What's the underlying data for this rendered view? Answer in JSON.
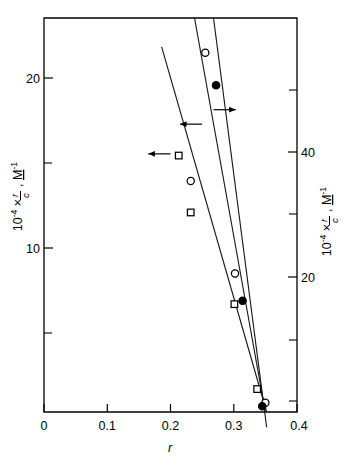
{
  "figure": {
    "title": "",
    "background_color": "#ffffff",
    "ink_color": "#000000"
  },
  "chart_data": {
    "type": "scatter",
    "title": "",
    "subtitle": "",
    "xlabel": "r",
    "ylabel": "10⁻⁴ × r/c,  M⁻¹",
    "ylabel_right": "10⁻⁴ × r/c,  M⁻¹",
    "xlim": [
      0,
      0.4
    ],
    "ylim": [
      0,
      23.2
    ],
    "ylim_right": [
      0,
      54.5
    ],
    "grid": false,
    "legend": "none",
    "xticks": [
      "0",
      "0.1",
      "0.2",
      "0.3",
      "0.4"
    ],
    "xtick_values": [
      0,
      0.1,
      0.2,
      0.3,
      0.4
    ],
    "yticks_left": [
      "10",
      "20"
    ],
    "ytick_values_left": [
      10,
      20
    ],
    "ytick_minor_left": [
      5,
      15
    ],
    "yticks_right": [
      "20",
      "40"
    ],
    "ytick_values_right": [
      20,
      40
    ],
    "ytick_minor_right": [
      10,
      30,
      50
    ],
    "series": [
      {
        "name": "open-circle-series",
        "marker": "open-circle",
        "axis": "left",
        "points": [
          {
            "x": 0.255,
            "y": 21.15
          },
          {
            "x": 0.232,
            "y": 13.6
          },
          {
            "x": 0.302,
            "y": 8.15
          },
          {
            "x": 0.35,
            "y": 0.55
          }
        ]
      },
      {
        "name": "open-square-series",
        "marker": "open-square",
        "axis": "left",
        "points": [
          {
            "x": 0.213,
            "y": 15.1
          },
          {
            "x": 0.232,
            "y": 11.75
          },
          {
            "x": 0.301,
            "y": 6.35
          },
          {
            "x": 0.337,
            "y": 1.35
          }
        ]
      },
      {
        "name": "filled-circle-series",
        "marker": "filled-circle",
        "axis": "right",
        "points": [
          {
            "x": 0.272,
            "y": 45.2
          },
          {
            "x": 0.314,
            "y": 15.4
          },
          {
            "x": 0.345,
            "y": 0.8
          }
        ]
      }
    ],
    "fit_lines": [
      {
        "name": "left-fit-line",
        "x1": 0.186,
        "y1": 21.5,
        "x2": 0.352,
        "y2": 0.0
      },
      {
        "name": "middle-fit-line",
        "x1": 0.238,
        "y1": 23.2,
        "x2": 0.35,
        "y2": 0.0
      },
      {
        "name": "right-fit-line",
        "x1": 0.268,
        "y1": 23.2,
        "x2": 0.352,
        "y2": -0.9
      }
    ],
    "annotations": [
      {
        "name": "arrow-left-axis-lower",
        "direction": "left",
        "x_tail": 0.2,
        "x_head": 0.165,
        "y": 15.2
      },
      {
        "name": "arrow-left-axis-upper",
        "direction": "left",
        "x_tail": 0.25,
        "x_head": 0.215,
        "y": 16.95
      },
      {
        "name": "arrow-right-axis",
        "direction": "right",
        "x_tail": 0.268,
        "x_head": 0.303,
        "y": 17.8
      }
    ]
  },
  "axes": {
    "x_axis_label": "r",
    "y_axis_left": {
      "prefix": "10",
      "exponent": "-4",
      "times": "×",
      "numerator": "r",
      "denominator": "c",
      "comma": ",",
      "unit": "M",
      "unit_exponent": "-1"
    },
    "y_axis_right": {
      "prefix": "10",
      "exponent": "-4",
      "times": "×",
      "numerator": "r",
      "denominator": "c",
      "comma": ",",
      "unit": "M",
      "unit_exponent": "-1"
    }
  }
}
